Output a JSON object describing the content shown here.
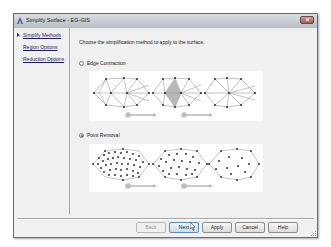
{
  "window": {
    "title": "Simplify Surface - EG-GIS",
    "close_label": "✕"
  },
  "nav": {
    "items": [
      {
        "label": "Simplify Methods",
        "active": true
      },
      {
        "label": "Region Options",
        "active": false
      },
      {
        "label": "Reduction Options",
        "active": false
      }
    ]
  },
  "content": {
    "instruction": "Choose the simplification method to apply to the surface.",
    "options": [
      {
        "label": "Edge Contraction",
        "selected": false
      },
      {
        "label": "Point Removal",
        "selected": true
      }
    ]
  },
  "buttons": {
    "back": "Back",
    "next": "Next",
    "apply": "Apply",
    "cancel": "Cancel",
    "help": "Help"
  },
  "colors": {
    "highlight_cell": "#b8b8b8",
    "arrow": "#bdbdbd",
    "mesh_line": "#9a9a9a",
    "vertex": "#333333"
  }
}
